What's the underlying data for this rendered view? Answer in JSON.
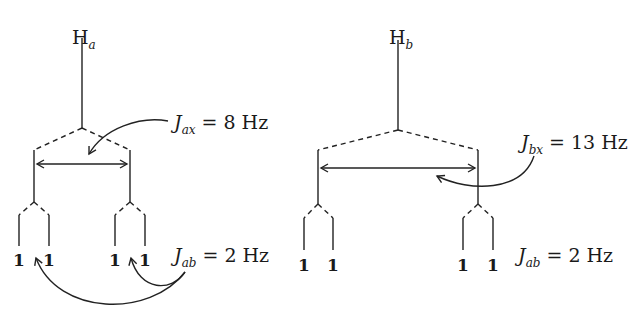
{
  "figure": {
    "left_tree": {
      "nucleus": "H",
      "nucleus_subscript": "a",
      "coupling_large": {
        "symbol": "J",
        "subscript": "ax",
        "equals": "=",
        "value": "8 Hz"
      },
      "coupling_small": {
        "symbol": "J",
        "subscript": "ab",
        "equals": "=",
        "value": "2 Hz"
      },
      "intensities": [
        "1",
        "1",
        "1",
        "1"
      ]
    },
    "right_tree": {
      "nucleus": "H",
      "nucleus_subscript": "b",
      "coupling_large": {
        "symbol": "J",
        "subscript": "bx",
        "equals": "=",
        "value": "13 Hz"
      },
      "coupling_small": {
        "symbol": "J",
        "subscript": "ab",
        "equals": "=",
        "value": "2 Hz"
      },
      "intensities": [
        "1",
        "1",
        "1",
        "1"
      ]
    }
  }
}
